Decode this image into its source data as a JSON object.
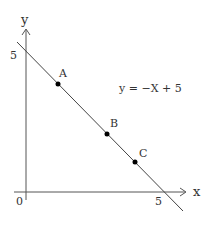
{
  "diagram": {
    "equation": "y = −X + 5",
    "axes": {
      "x_label": "x",
      "y_label": "y",
      "origin_label": "0",
      "x_tick": "5",
      "y_tick": "5"
    },
    "points": [
      {
        "label": "A",
        "cx": 58,
        "cy": 84
      },
      {
        "label": "B",
        "cx": 107,
        "cy": 134
      },
      {
        "label": "C",
        "cx": 135,
        "cy": 162
      }
    ],
    "colors": {
      "axis": "#555555",
      "line": "#444444",
      "point": "#000000"
    }
  }
}
